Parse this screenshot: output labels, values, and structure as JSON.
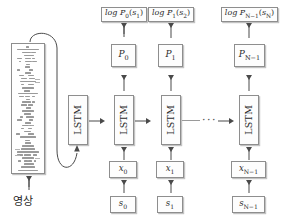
{
  "diagram": {
    "language": "ko",
    "colors": {
      "box_border": "#8e8e8e",
      "box_fill": "#fdfdfd",
      "arrow": "#4a4a4a",
      "cnn_layer": "#9a9a9a",
      "background": "#ffffff",
      "text": "#2b2b2b"
    },
    "image_input": {
      "label": "영상",
      "cnn_block_name": "deep-convolutional-network"
    },
    "ellipsis": "···",
    "columns": [
      {
        "id": "init",
        "lstm": "LSTM",
        "log_label": null,
        "p_label": null,
        "x_label": null,
        "s_label": null
      },
      {
        "id": "t0",
        "lstm": "LSTM",
        "log_label": "log P₀(s₁)",
        "log_main": "log P",
        "log_sub": "0",
        "log_arg_main": "s",
        "log_arg_sub": "1",
        "p_main": "P",
        "p_sub": "0",
        "x_main": "x",
        "x_sub": "0",
        "s_main": "s",
        "s_sub": "0"
      },
      {
        "id": "t1",
        "lstm": "LSTM",
        "log_label": "log P₁(s₂)",
        "log_main": "log P",
        "log_sub": "1",
        "log_arg_main": "s",
        "log_arg_sub": "2",
        "p_main": "P",
        "p_sub": "1",
        "x_main": "x",
        "x_sub": "1",
        "s_main": "s",
        "s_sub": "1"
      },
      {
        "id": "tN",
        "lstm": "LSTM",
        "log_label": "log Pₙ₋₁(sₙ)",
        "log_main": "log P",
        "log_sub": "N−1",
        "log_arg_main": "s",
        "log_arg_sub": "N",
        "p_main": "P",
        "p_sub": "N−1",
        "x_main": "x",
        "x_sub": "N−1",
        "s_main": "s",
        "s_sub": "N−1"
      }
    ]
  }
}
